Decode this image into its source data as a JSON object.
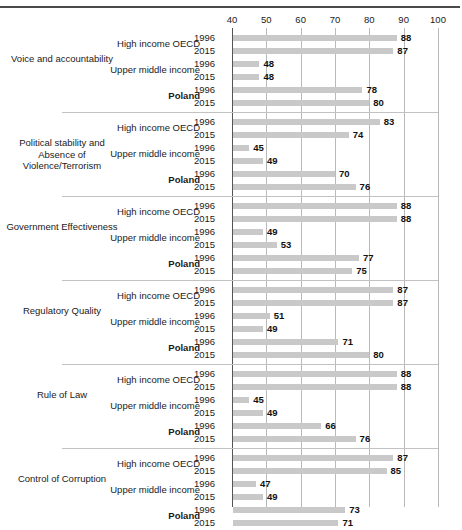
{
  "header": {
    "running_head": ""
  },
  "chart_data": {
    "type": "bar",
    "title": "",
    "xlabel": "",
    "ylabel": "",
    "xlim": [
      40,
      100
    ],
    "xticks": [
      40,
      50,
      60,
      70,
      80,
      90,
      100
    ],
    "grid": true,
    "legend": "none",
    "orientation": "horizontal",
    "bar_color": "#c9c9c9",
    "series_labels": [
      "High income OECD",
      "Upper middle income",
      "Poland"
    ],
    "years": [
      "1996",
      "2015"
    ],
    "groups": [
      {
        "name": "Voice and accountability",
        "rows": [
          {
            "series": "High income OECD",
            "year": "1996",
            "value": 88
          },
          {
            "series": "High income OECD",
            "year": "2015",
            "value": 87
          },
          {
            "series": "Upper middle income",
            "year": "1996",
            "value": 48
          },
          {
            "series": "Upper middle income",
            "year": "2015",
            "value": 48
          },
          {
            "series": "Poland",
            "year": "1996",
            "value": 78
          },
          {
            "series": "Poland",
            "year": "2015",
            "value": 80
          }
        ]
      },
      {
        "name": "Political stability and Absence of Violence/Terrorism",
        "rows": [
          {
            "series": "High income OECD",
            "year": "1996",
            "value": 83
          },
          {
            "series": "High income OECD",
            "year": "2015",
            "value": 74
          },
          {
            "series": "Upper middle income",
            "year": "1996",
            "value": 45
          },
          {
            "series": "Upper middle income",
            "year": "2015",
            "value": 49
          },
          {
            "series": "Poland",
            "year": "1996",
            "value": 70
          },
          {
            "series": "Poland",
            "year": "2015",
            "value": 76
          }
        ]
      },
      {
        "name": "Government Effectiveness",
        "rows": [
          {
            "series": "High income OECD",
            "year": "1996",
            "value": 88
          },
          {
            "series": "High income OECD",
            "year": "2015",
            "value": 88
          },
          {
            "series": "Upper middle income",
            "year": "1996",
            "value": 49
          },
          {
            "series": "Upper middle income",
            "year": "2015",
            "value": 53
          },
          {
            "series": "Poland",
            "year": "1996",
            "value": 77
          },
          {
            "series": "Poland",
            "year": "2015",
            "value": 75
          }
        ]
      },
      {
        "name": "Regulatory Quality",
        "rows": [
          {
            "series": "High income OECD",
            "year": "1996",
            "value": 87
          },
          {
            "series": "High income OECD",
            "year": "2015",
            "value": 87
          },
          {
            "series": "Upper middle income",
            "year": "1996",
            "value": 51
          },
          {
            "series": "Upper middle income",
            "year": "2015",
            "value": 49
          },
          {
            "series": "Poland",
            "year": "1996",
            "value": 71
          },
          {
            "series": "Poland",
            "year": "2015",
            "value": 80
          }
        ]
      },
      {
        "name": "Rule of Law",
        "rows": [
          {
            "series": "High income OECD",
            "year": "1996",
            "value": 88
          },
          {
            "series": "High income OECD",
            "year": "2015",
            "value": 88
          },
          {
            "series": "Upper middle income",
            "year": "1996",
            "value": 45
          },
          {
            "series": "Upper middle income",
            "year": "2015",
            "value": 49
          },
          {
            "series": "Poland",
            "year": "1996",
            "value": 66
          },
          {
            "series": "Poland",
            "year": "2015",
            "value": 76
          }
        ]
      },
      {
        "name": "Control of Corruption",
        "rows": [
          {
            "series": "High income OECD",
            "year": "1996",
            "value": 87
          },
          {
            "series": "High income OECD",
            "year": "2015",
            "value": 85
          },
          {
            "series": "Upper middle income",
            "year": "1996",
            "value": 47
          },
          {
            "series": "Upper middle income",
            "year": "2015",
            "value": 49
          },
          {
            "series": "Poland",
            "year": "1996",
            "value": 73
          },
          {
            "series": "Poland",
            "year": "2015",
            "value": 71
          }
        ]
      }
    ]
  }
}
